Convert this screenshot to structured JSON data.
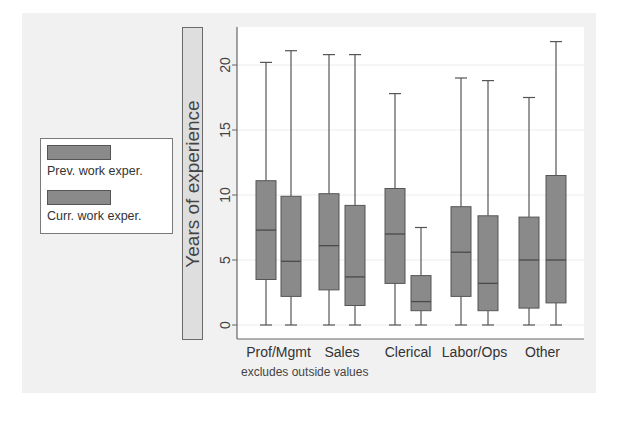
{
  "chart_data": {
    "type": "box",
    "title": "",
    "ylabel": "Years of experience",
    "xlabel": "",
    "ylim": [
      0,
      22
    ],
    "yticks": [
      0,
      5,
      10,
      15,
      20
    ],
    "grid": true,
    "legend_position": "left",
    "note": "excludes outside values",
    "categories": [
      "Prof/Mgmt",
      "Sales",
      "Clerical",
      "Labor/Ops",
      "Other"
    ],
    "series": [
      {
        "name": "Prev. work exper.",
        "boxes": [
          {
            "min": 0,
            "q1": 3.5,
            "median": 7.3,
            "q3": 11.1,
            "max": 20.2
          },
          {
            "min": 0,
            "q1": 2.7,
            "median": 6.1,
            "q3": 10.1,
            "max": 20.8
          },
          {
            "min": 0,
            "q1": 3.2,
            "median": 7.0,
            "q3": 10.5,
            "max": 17.8
          },
          {
            "min": 0,
            "q1": 2.2,
            "median": 5.6,
            "q3": 9.1,
            "max": 19.0
          },
          {
            "min": 0,
            "q1": 1.3,
            "median": 5.0,
            "q3": 8.3,
            "max": 17.5
          }
        ]
      },
      {
        "name": "Curr. work exper.",
        "boxes": [
          {
            "min": 0,
            "q1": 2.2,
            "median": 4.9,
            "q3": 9.9,
            "max": 21.1
          },
          {
            "min": 0,
            "q1": 1.5,
            "median": 3.7,
            "q3": 9.2,
            "max": 20.8
          },
          {
            "min": 0,
            "q1": 1.1,
            "median": 1.8,
            "q3": 3.8,
            "max": 7.5
          },
          {
            "min": 0,
            "q1": 1.1,
            "median": 3.2,
            "q3": 8.4,
            "max": 18.8
          },
          {
            "min": 0,
            "q1": 1.7,
            "median": 5.0,
            "q3": 11.5,
            "max": 21.8
          }
        ]
      }
    ]
  },
  "legend": {
    "items": [
      {
        "label": "Prev. work exper.",
        "color": "#8a8a8a"
      },
      {
        "label": "Curr. work exper.",
        "color": "#8a8a8a"
      }
    ]
  },
  "axis": {
    "ytitle": "Years of experience",
    "ytick_labels": [
      "0",
      "5",
      "10",
      "15",
      "20"
    ],
    "xcategory_labels": [
      "Prof/Mgmt",
      "Sales",
      "Clerical",
      "Labor/Ops",
      "Other"
    ]
  },
  "note": "excludes outside values",
  "colors": {
    "box_fill": "#8a8a8a",
    "box_stroke": "#555555",
    "panel_bg": "#f1f1f1",
    "plot_bg": "#ffffff"
  }
}
